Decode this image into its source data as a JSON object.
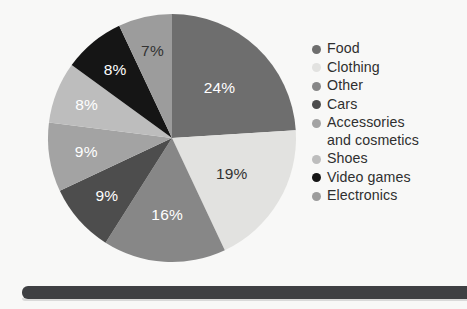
{
  "chart_data": {
    "type": "pie",
    "title": "",
    "categories": [
      "Food",
      "Clothing",
      "Other",
      "Cars",
      "Accessories and cosmetics",
      "Shoes",
      "Video games",
      "Electronics"
    ],
    "values": [
      24,
      19,
      16,
      9,
      9,
      8,
      8,
      7
    ],
    "value_suffix": "%",
    "data_labels": [
      "24%",
      "19%",
      "16%",
      "9%",
      "9%",
      "8%",
      "8%",
      "7%"
    ],
    "colors": [
      "#6e6e6e",
      "#e2e2e0",
      "#878787",
      "#4d4d4d",
      "#a3a3a3",
      "#bdbdbd",
      "#151515",
      "#9c9c9c"
    ],
    "label_text_colors": [
      "#ffffff",
      "#333333",
      "#ffffff",
      "#ffffff",
      "#ffffff",
      "#ffffff",
      "#ffffff",
      "#333333"
    ],
    "legend_position": "right",
    "start_angle_deg": 0,
    "direction": "clockwise",
    "grid": false,
    "xlabel": "",
    "ylabel": ""
  },
  "legend": {
    "items": [
      {
        "label": "Food",
        "color": "#6e6e6e",
        "value": "24%"
      },
      {
        "label": "Clothing",
        "color": "#e2e2e0",
        "value": "19%"
      },
      {
        "label": "Other",
        "color": "#878787",
        "value": "16%"
      },
      {
        "label": "Cars",
        "color": "#4d4d4d",
        "value": "9%"
      },
      {
        "label": "Accessories\nand cosmetics",
        "color": "#a3a3a3",
        "value": "9%"
      },
      {
        "label": "Shoes",
        "color": "#bdbdbd",
        "value": "8%"
      },
      {
        "label": "Video games",
        "color": "#151515",
        "value": "8%"
      },
      {
        "label": "Electronics",
        "color": "#9c9c9c",
        "value": "7%"
      }
    ]
  },
  "slide": {
    "background_color": "#f8f8f7",
    "base_bar_color": "#3f4043"
  }
}
